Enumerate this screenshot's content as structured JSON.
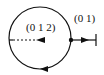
{
  "diagram": {
    "inner_label": "(0 1 2)",
    "outer_label": "(0 1)",
    "stroke_color": "#111111",
    "background": "#ffffff"
  }
}
